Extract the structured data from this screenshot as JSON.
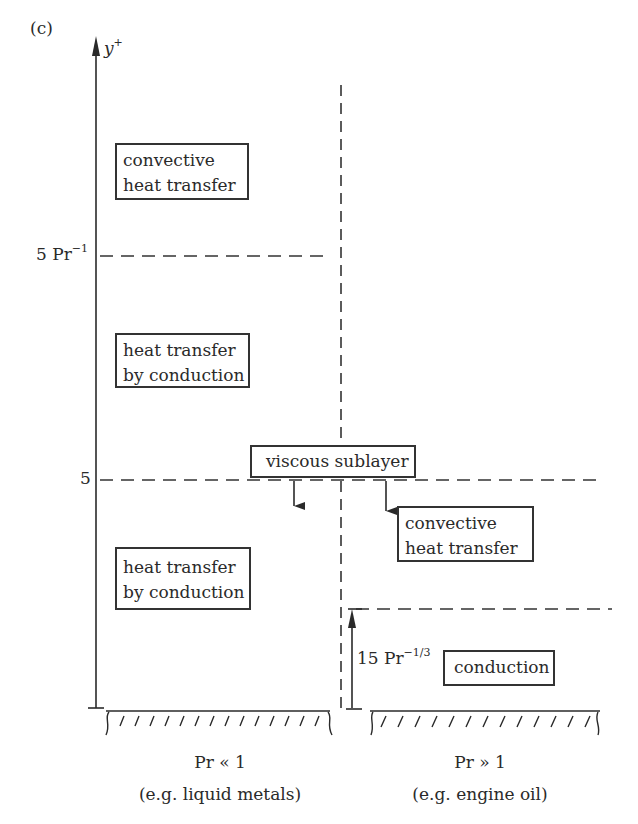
{
  "figure": {
    "panel_label": "(c)",
    "y_axis": {
      "label_base": "y",
      "label_sup": "+"
    },
    "y_ticks": [
      {
        "base": "5 Pr",
        "sup": "−1"
      },
      {
        "base": "5",
        "sup": ""
      }
    ],
    "left_regions": [
      {
        "line1": "convective",
        "line2": "heat transfer"
      },
      {
        "line1": "heat transfer",
        "line2": "by conduction"
      },
      {
        "line1": "heat transfer",
        "line2": "by conduction"
      }
    ],
    "viscous_sublayer_label": "viscous sublayer",
    "right_regions": [
      {
        "line1": "convective",
        "line2": "heat transfer"
      },
      {
        "line1": "conduction"
      }
    ],
    "right_height_label": {
      "base": "15 Pr",
      "sup": "−1/3"
    },
    "bottom_labels": {
      "left": {
        "line1": "Pr « 1",
        "line2": "(e.g. liquid metals)"
      },
      "right": {
        "line1": "Pr » 1",
        "line2": "(e.g. engine oil)"
      }
    },
    "colors": {
      "ink": "#2a2a2a",
      "background": "#ffffff"
    }
  }
}
